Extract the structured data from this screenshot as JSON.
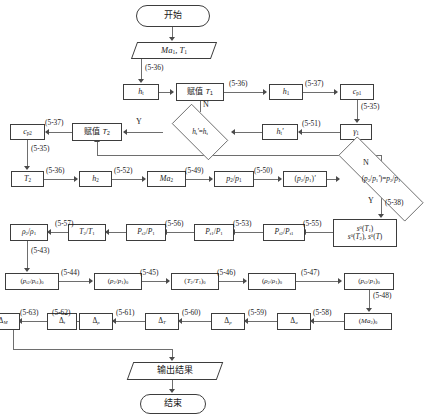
{
  "diagram": {
    "title_lang": "zh-CN",
    "nodes": {
      "start": "开始",
      "input": "Ma₁, T₁",
      "ht": "h_t",
      "assign_t1": "赋值 T₁",
      "h1": "h₁",
      "cp1": "c_p1",
      "gamma1": "γ₁",
      "ht_prime": "h_t'",
      "decision1": "h_t'=h_t",
      "assign_t2": "赋值 T₂",
      "cp2": "c_p2",
      "t2": "T₂",
      "h2": "h₂",
      "ma2": "Ma₂",
      "p2p1": "p₂/p₁",
      "p2p1_prime": "(p₂/p₁)'",
      "decision2": "(p₂/p₁')=p₂/p₁",
      "s0": "s⁰(T₁) s⁰(T₂), s⁰(T)",
      "s0_line1": "s⁰(T₁)",
      "s0_line2": "s⁰(T₂), s⁰(T)",
      "pt2pt1": "P_t2/P_t1",
      "pt1p1": "P_t1/P₁",
      "pt2p1": "P_t2/P₁",
      "t2t1": "T₂/T₁",
      "rho2rho1": "ρ₂/ρ₁",
      "pt2pt1_0": "(p_t2/p_t1)₀",
      "p2p1_0": "(p₂/p₁)₀",
      "t2t1_0": "(T₂/T₁)₀",
      "rho2rho1_0": "(ρ₂/ρ₁)₀",
      "pt2p1_0": "(p_t2/p₁)₀",
      "ma2_0": "(Ma₂)₀",
      "delta_a": "Δ_a",
      "delta_p": "Δ_p",
      "delta_T": "Δ_T",
      "delta_rho": "Δ_ρ",
      "delta_t": "Δ_t",
      "delta_M": "Δ_M",
      "output": "输出结果",
      "end": "结束"
    },
    "edge_labels": {
      "e536_a": "(5-36)",
      "e536_b": "(5-36)",
      "e537_a": "(5-37)",
      "e535_a": "(5-35)",
      "e551": "(5-51)",
      "e537_b": "(5-37)",
      "e535_b": "(5-35)",
      "e536_c": "(5-36)",
      "e552": "(5-52)",
      "e549": "(5-49)",
      "e550": "(5-50)",
      "e538": "(5-38)",
      "e555": "(5-55)",
      "e553": "(5-53)",
      "e556": "(5-56)",
      "e557": "(5-57)",
      "e543": "(5-43)",
      "e544": "(5-44)",
      "e545": "(5-45)",
      "e546": "(5-46)",
      "e547": "(5-47)",
      "e548": "(5-48)",
      "e558": "(5-58)",
      "e559": "(5-59)",
      "e560": "(5-60)",
      "e561": "(5-61)",
      "e562": "(5-62)",
      "e563": "(5-63)"
    },
    "branch_labels": {
      "d1_yes": "Y",
      "d1_no": "N",
      "d2_yes": "Y",
      "d2_no": "N"
    },
    "colors": {
      "stroke": "#3d3d3d",
      "line": "#6e6e6e",
      "background": "#ffffff",
      "text": "#1a1a1a"
    }
  }
}
